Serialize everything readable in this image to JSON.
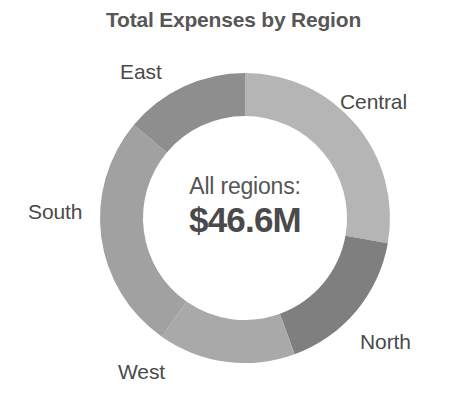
{
  "chart_data": {
    "type": "pie",
    "variant": "donut",
    "title": "Total Expenses by Region",
    "xlabel": "",
    "ylabel": "",
    "legend_position": "outside-labels",
    "grid": false,
    "total_label": "All regions:",
    "total_value": "$46.6M",
    "total_numeric": 46.6,
    "units": "millions USD",
    "start_angle_deg": 0,
    "direction": "clockwise",
    "categories": [
      "Central",
      "North",
      "West",
      "South",
      "East"
    ],
    "values": [
      12.9,
      7.8,
      7.1,
      12.3,
      6.5
    ],
    "percentages": [
      27.8,
      16.7,
      15.3,
      26.4,
      13.9
    ],
    "colors": [
      "#b5b5b5",
      "#7f7f7f",
      "#a9a9a9",
      "#a1a1a1",
      "#8e8e8e"
    ],
    "slices": [
      {
        "label": "Central",
        "value": 12.9,
        "percent": 27.8,
        "color": "#b5b5b5",
        "start_deg": 0,
        "end_deg": 100
      },
      {
        "label": "North",
        "value": 7.8,
        "percent": 16.7,
        "color": "#7f7f7f",
        "start_deg": 100,
        "end_deg": 160
      },
      {
        "label": "West",
        "value": 7.1,
        "percent": 15.3,
        "color": "#a9a9a9",
        "start_deg": 160,
        "end_deg": 215
      },
      {
        "label": "South",
        "value": 12.3,
        "percent": 26.4,
        "color": "#a1a1a1",
        "start_deg": 215,
        "end_deg": 310
      },
      {
        "label": "East",
        "value": 6.5,
        "percent": 13.9,
        "color": "#8e8e8e",
        "start_deg": 310,
        "end_deg": 360
      }
    ],
    "geometry": {
      "center_x": 245,
      "center_y": 218,
      "outer_radius": 145,
      "inner_radius": 102
    }
  },
  "labels": {
    "east": "East",
    "central": "Central",
    "south": "South",
    "north": "North",
    "west": "West"
  },
  "center": {
    "caption": "All regions:",
    "value": "$46.6M"
  },
  "title": "Total Expenses by Region"
}
